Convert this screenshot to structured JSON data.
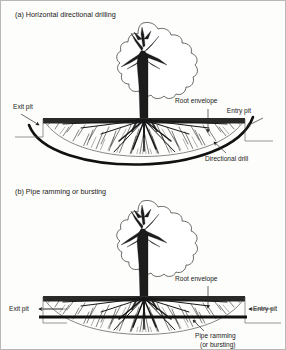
{
  "figure": {
    "title_a": "(a) Horizontal directional drilling",
    "title_b": "(b) Pipe ramming or bursting",
    "background_color": "#fdfdfb",
    "ink_color": "#111111"
  },
  "panel_a": {
    "caption": "(a) Horizontal directional drilling",
    "labels": {
      "exit_pit": "Exit pit",
      "entry_pit": "Entry pit",
      "root_envelope": "Root envelope",
      "directional_drill": "Directional drill"
    }
  },
  "panel_b": {
    "caption": "(b) Pipe ramming or bursting",
    "labels": {
      "exit_pit": "Exit pit",
      "entry_pit": "Entry pit",
      "root_envelope": "Root envelope",
      "method_line1": "Pipe ramming",
      "method_line2": "(or bursting)"
    }
  }
}
